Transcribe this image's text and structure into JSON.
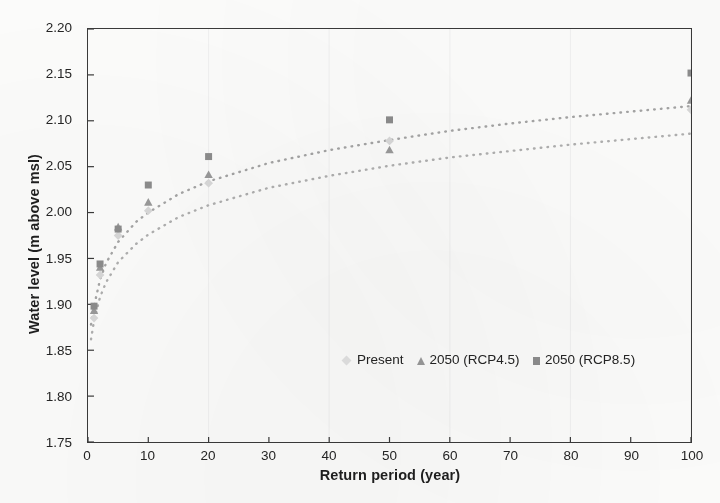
{
  "chart_data": {
    "type": "scatter",
    "title": "",
    "xlabel": "Return period (year)",
    "ylabel": "Water level (m above msl)",
    "xlim": [
      0,
      100
    ],
    "ylim": [
      1.75,
      2.2
    ],
    "xticks": [
      "0",
      "10",
      "20",
      "30",
      "40",
      "50",
      "60",
      "70",
      "80",
      "90",
      "100"
    ],
    "yticks": [
      "1.75",
      "1.80",
      "1.85",
      "1.90",
      "1.95",
      "2.00",
      "2.05",
      "2.10",
      "2.15",
      "2.20"
    ],
    "grid": false,
    "legend_position": "inside-lower-center",
    "x": [
      1,
      2,
      5,
      10,
      20,
      50,
      100
    ],
    "series": [
      {
        "name": "Present",
        "marker": "diamond",
        "color": "#d9d9d9",
        "values": [
          1.885,
          1.932,
          1.975,
          2.002,
          2.032,
          2.078,
          2.112
        ],
        "trendline": true
      },
      {
        "name": "2050 (RCP4.5)",
        "marker": "triangle",
        "color": "#9a9a9a",
        "values": [
          1.893,
          1.94,
          1.984,
          2.011,
          2.041,
          2.068,
          2.122
        ],
        "trendline": true
      },
      {
        "name": "2050 (RCP8.5)",
        "marker": "square",
        "color": "#8d8d8d",
        "values": [
          1.898,
          1.944,
          1.982,
          2.03,
          2.061,
          2.101,
          2.152
        ],
        "trendline": true
      }
    ],
    "trend_curves": [
      {
        "name": "2050 (RCP8.5) trend",
        "color": "#a5a5a5",
        "points_x": [
          0.5,
          1,
          2,
          3,
          5,
          8,
          10,
          15,
          20,
          30,
          40,
          50,
          60,
          70,
          80,
          90,
          100
        ],
        "points_y": [
          1.878,
          1.898,
          1.927,
          1.945,
          1.968,
          1.99,
          2.0,
          2.02,
          2.034,
          2.054,
          2.068,
          2.079,
          2.089,
          2.097,
          2.104,
          2.11,
          2.116
        ]
      },
      {
        "name": "2050 (RCP4.5) trend",
        "color": "#b0b0b0",
        "points_x": [
          0.5,
          1,
          2,
          3,
          5,
          8,
          10,
          15,
          20,
          30,
          40,
          50,
          60,
          70,
          80,
          90,
          100
        ],
        "points_y": [
          1.862,
          1.882,
          1.908,
          1.924,
          1.946,
          1.966,
          1.976,
          1.995,
          2.008,
          2.027,
          2.04,
          2.051,
          2.06,
          2.067,
          2.074,
          2.08,
          2.086
        ]
      }
    ],
    "legend": [
      {
        "label": "Present",
        "marker": "diamond-faint"
      },
      {
        "label": "2050 (RCP4.5)",
        "marker": "triangle"
      },
      {
        "label": "2050 (RCP8.5)",
        "marker": "square"
      }
    ]
  }
}
